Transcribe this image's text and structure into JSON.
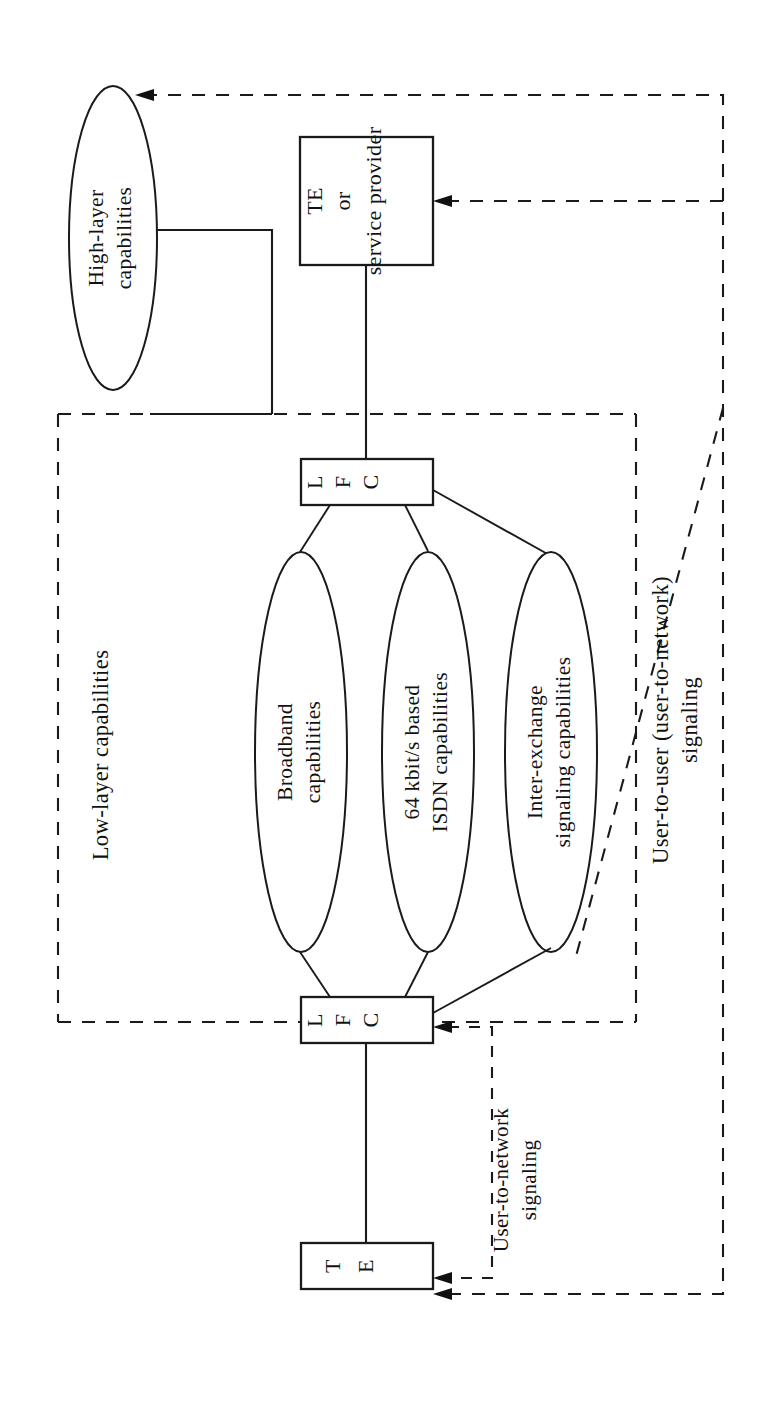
{
  "figure": {
    "orientation": "rotated-90-ccw",
    "background_color": "#ffffff",
    "line_color": "#1a1a1a"
  },
  "nodes": {
    "high_layer": {
      "label_line1": "High-layer",
      "label_line2": "capabilities",
      "shape": "ellipse"
    },
    "te_service_provider": {
      "label_line1": "TE",
      "label_line2": "or",
      "label_line3": "service provider",
      "shape": "box"
    },
    "lfc_top": {
      "label": "L F C",
      "letters": [
        "L",
        "F",
        "C"
      ],
      "shape": "box"
    },
    "lfc_bottom": {
      "label": "L F C",
      "letters": [
        "L",
        "F",
        "C"
      ],
      "shape": "box"
    },
    "te_bottom": {
      "label": "T E",
      "letters": [
        "T",
        "E"
      ],
      "shape": "box"
    },
    "broadband": {
      "label_line1": "Broadband",
      "label_line2": "capabilities",
      "shape": "ellipse"
    },
    "isdn_64k": {
      "label_line1": "64 kbit/s based",
      "label_line2": "ISDN capabilities",
      "shape": "ellipse"
    },
    "inter_exchange": {
      "label_line1": "Inter-exchange",
      "label_line2": "signaling capabilities",
      "shape": "ellipse"
    }
  },
  "regions": {
    "low_layer": {
      "label": "Low-layer capabilities",
      "border": "dashed"
    }
  },
  "annotations": {
    "user_to_user": {
      "line1": "User-to-user (user-to-network)",
      "line2": "signaling"
    },
    "user_to_network": {
      "line1": "User-to-network",
      "line2": "signaling"
    }
  }
}
